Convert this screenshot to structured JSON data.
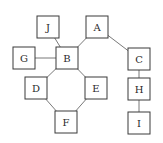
{
  "diagram": {
    "type": "tree-graph",
    "node_size": 22,
    "colors": {
      "node_border": "#3a3a3a",
      "edge": "#6a6a6a",
      "text": "#2a2a2a",
      "background": "#ffffff"
    },
    "nodes": [
      {
        "id": "J",
        "label": "J",
        "x": 48,
        "y": 27
      },
      {
        "id": "A",
        "label": "A",
        "x": 97,
        "y": 27
      },
      {
        "id": "G",
        "label": "G",
        "x": 24,
        "y": 58
      },
      {
        "id": "B",
        "label": "B",
        "x": 67,
        "y": 58
      },
      {
        "id": "C",
        "label": "C",
        "x": 139,
        "y": 59
      },
      {
        "id": "D",
        "label": "D",
        "x": 36,
        "y": 88
      },
      {
        "id": "E",
        "label": "E",
        "x": 96,
        "y": 88
      },
      {
        "id": "H",
        "label": "H",
        "x": 139,
        "y": 89
      },
      {
        "id": "F",
        "label": "F",
        "x": 66,
        "y": 122
      },
      {
        "id": "I",
        "label": "I",
        "x": 139,
        "y": 123
      }
    ],
    "edges": [
      [
        "J",
        "B"
      ],
      [
        "A",
        "B"
      ],
      [
        "A",
        "C"
      ],
      [
        "G",
        "B"
      ],
      [
        "B",
        "D"
      ],
      [
        "B",
        "E"
      ],
      [
        "D",
        "F"
      ],
      [
        "E",
        "F"
      ],
      [
        "C",
        "H"
      ],
      [
        "H",
        "I"
      ]
    ]
  }
}
